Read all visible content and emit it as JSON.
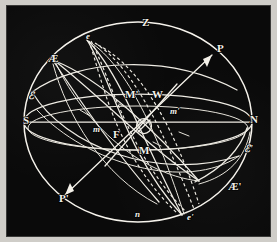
{
  "figure": {
    "kind": "celestial-sphere-diagram",
    "background_color": "#0a0a0a",
    "line_color": "#efece4",
    "frame_color": "#cfcdc8"
  },
  "labels": {
    "zenith": "Z",
    "pole_upper": "P",
    "pole_lower": "P'",
    "equinox_upper": "Æ",
    "equinox_lower": "Æ'",
    "ecliptic_left": "ℰ",
    "ecliptic_right": "ℰ'",
    "south": "S",
    "north": "N",
    "west": "W",
    "east": "F",
    "node_e_upper": "e",
    "node_e_lower": "e'",
    "nadir_n": "n",
    "moon_upper": "M'",
    "moon_lower": "M",
    "moon_small_upper": "m'",
    "moon_small_lower": "m",
    "center_symbol": "Ø"
  },
  "label_positions": [
    {
      "name": "zenith",
      "text": "Z",
      "x": 135,
      "y": 20,
      "style": "lbl-cap"
    },
    {
      "name": "pole-upper",
      "text": "P",
      "x": 210,
      "y": 46,
      "style": "lbl-cap"
    },
    {
      "name": "pole-lower",
      "text": "P'",
      "x": 52,
      "y": 196,
      "style": "lbl-cap"
    },
    {
      "name": "equinox-upper",
      "text": "Æ",
      "x": 41,
      "y": 56,
      "style": "lbl-ae"
    },
    {
      "name": "equinox-lower",
      "text": "Æ'",
      "x": 221,
      "y": 184,
      "style": "lbl-ae"
    },
    {
      "name": "ecliptic-left",
      "text": "ℰ",
      "x": 21,
      "y": 93,
      "style": "lbl-scr"
    },
    {
      "name": "ecliptic-right",
      "text": "ℰ'",
      "x": 237,
      "y": 146,
      "style": "lbl-scr"
    },
    {
      "name": "south-point",
      "text": "S",
      "x": 16,
      "y": 118,
      "style": "lbl-cap"
    },
    {
      "name": "north-point",
      "text": "N",
      "x": 243,
      "y": 117,
      "style": "lbl-cap"
    },
    {
      "name": "west-point",
      "text": "W",
      "x": 145,
      "y": 92,
      "style": "lbl-cap"
    },
    {
      "name": "east-point",
      "text": "F",
      "x": 106,
      "y": 132,
      "style": "lbl-cap"
    },
    {
      "name": "node-e-upper",
      "text": "e",
      "x": 79,
      "y": 33,
      "style": "lbl-sm"
    },
    {
      "name": "node-e-lower",
      "text": "e'",
      "x": 180,
      "y": 214,
      "style": "lbl-sm"
    },
    {
      "name": "nadir-n",
      "text": "n",
      "x": 128,
      "y": 211,
      "style": "lbl-sm"
    },
    {
      "name": "moon-upper",
      "text": "M'",
      "x": 118,
      "y": 92,
      "style": "lbl-cap"
    },
    {
      "name": "moon-lower",
      "text": "M",
      "x": 132,
      "y": 148,
      "style": "lbl-cap"
    },
    {
      "name": "moon-small-upper",
      "text": "m'",
      "x": 163,
      "y": 108,
      "style": "lbl-sm"
    },
    {
      "name": "moon-small-lower",
      "text": "m",
      "x": 86,
      "y": 126,
      "style": "lbl-sm"
    }
  ]
}
